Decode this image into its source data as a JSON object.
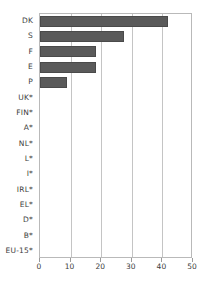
{
  "chart_data": {
    "type": "bar",
    "orientation": "horizontal",
    "title": "",
    "subtitle": "",
    "xlabel": "",
    "ylabel": "",
    "xlim": [
      0,
      50
    ],
    "xticks": [
      0,
      10,
      20,
      30,
      40,
      50
    ],
    "xtick_labels": [
      "0",
      "10",
      "20",
      "30",
      "40",
      "50"
    ],
    "grid": true,
    "grid_axis": "x",
    "legend": false,
    "legend_position": "none",
    "bar_color": "#5a5a5a",
    "bar_edge_color": "#4a4a4a",
    "axis_color": "#b9b9b9",
    "grid_color": "#c4c4c4",
    "text_color": "#3c3c3c",
    "background": "#ffffff",
    "categories": [
      "DK",
      "S",
      "F",
      "E",
      "P",
      "UK*",
      "FIN*",
      "A*",
      "NL*",
      "L*",
      "I*",
      "IRL*",
      "EL*",
      "D*",
      "B*",
      "EU-15*"
    ],
    "values": [
      41.8,
      27.5,
      18.4,
      18.3,
      8.8,
      0,
      0,
      0,
      0,
      0,
      0,
      0,
      0,
      0,
      0,
      0
    ],
    "series": [
      {
        "name": "",
        "values": [
          41.8,
          27.5,
          18.4,
          18.3,
          8.8,
          0,
          0,
          0,
          0,
          0,
          0,
          0,
          0,
          0,
          0,
          0
        ]
      }
    ],
    "annotations": []
  }
}
